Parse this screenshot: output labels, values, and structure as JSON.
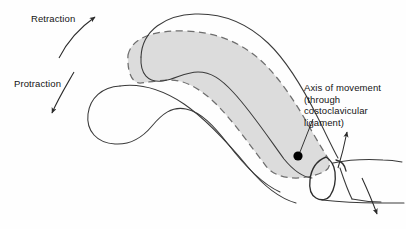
{
  "figure": {
    "background_color": "#fefefe",
    "line_color": "#3a3a3a",
    "shaded_region_fill": "#dcdcdc",
    "shaded_region_stroke": "#6e6e6e",
    "marker_color": "#000000",
    "width": 406,
    "height": 229
  },
  "labels": {
    "retraction": "Retraction",
    "protraction": "Protraction",
    "axis_line1": "Axis of movement",
    "axis_line2": "(through costoclavicular",
    "axis_line3": "ligament)"
  },
  "annotations": {
    "retraction_arrow": {
      "direction": "up-right",
      "description": "curved arrow pointing superolaterally"
    },
    "protraction_arrow": {
      "direction": "down-left",
      "description": "curved arrow pointing inferomedially"
    },
    "elevation_arrow": {
      "direction": "up",
      "description": "arrow at sternal end pointing superiorly"
    },
    "depression_arrow": {
      "direction": "down",
      "description": "arrow at sternal end pointing inferiorly"
    },
    "axis_marker": {
      "shape": "filled-circle",
      "cx": 298,
      "cy": 156,
      "r": 4.6
    },
    "leader_line": {
      "from_x": 312,
      "from_y": 119,
      "to_x": 300,
      "to_y": 152
    }
  },
  "structures": [
    {
      "name": "clavicle-neutral-shaded",
      "style": "gray fill, dashed outline"
    },
    {
      "name": "clavicle-elevated",
      "style": "solid outline, superior position"
    },
    {
      "name": "clavicle-depressed",
      "style": "solid outline, inferior position"
    },
    {
      "name": "sternal-end-joint",
      "style": "solid outline at medial end"
    },
    {
      "name": "first-rib-sternum",
      "style": "solid outline, inferomedial"
    }
  ]
}
